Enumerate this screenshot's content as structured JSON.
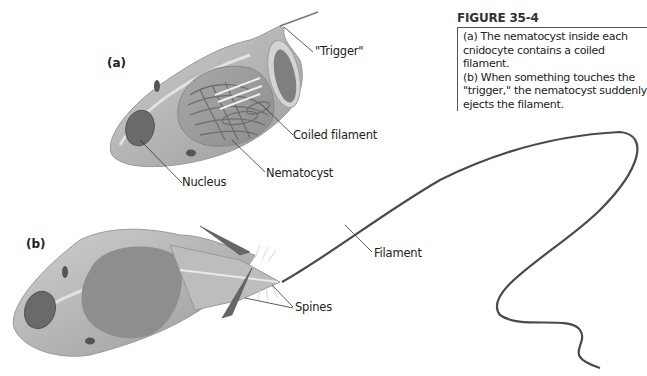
{
  "figure": {
    "title": "FIGURE 35-4",
    "caption_lines": [
      "(a) The nematocyst inside each",
      "cnidocyte contains a coiled filament.",
      "(b) When something touches the",
      "\"trigger,\" the nematocyst suddenly",
      "ejects the filament."
    ]
  },
  "panel_a": {
    "label": "(a)",
    "callouts": {
      "trigger": "\"Trigger\"",
      "coiled_filament": "Coiled filament",
      "nematocyst": "Nematocyst",
      "nucleus": "Nucleus"
    }
  },
  "panel_b": {
    "label": "(b)",
    "callouts": {
      "filament": "Filament",
      "spines": "Spines"
    }
  },
  "colors": {
    "cell_fill": "#b8b8b8",
    "cell_light": "#d6d6d6",
    "cell_dark": "#8c8c8c",
    "nucleus": "#6a6a6a",
    "line": "#333333"
  }
}
